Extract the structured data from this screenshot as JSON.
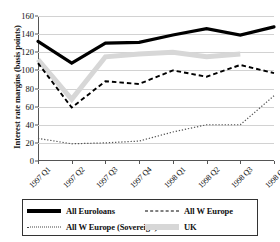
{
  "chart_data": {
    "type": "line",
    "title": "",
    "xlabel": "",
    "ylabel": "Interest rate margins (basis points)",
    "categories": [
      "1997 Q1",
      "1997 Q2",
      "1997 Q3",
      "1997 Q4",
      "1998 Q1",
      "1998 Q2",
      "1998 Q3",
      "1998 Q4"
    ],
    "ylim": [
      0,
      160
    ],
    "yticks": [
      0,
      20,
      40,
      60,
      80,
      100,
      120,
      140,
      160
    ],
    "grid": true,
    "legend_position": "bottom",
    "series": [
      {
        "name": "All Euroloans",
        "style": "solid-thick",
        "color": "#000000",
        "values": [
          132,
          108,
          130,
          131,
          139,
          146,
          139,
          148
        ]
      },
      {
        "name": "All W Europe",
        "style": "dashed",
        "color": "#000000",
        "values": [
          108,
          59,
          88,
          85,
          100,
          93,
          106,
          97
        ]
      },
      {
        "name": "All W Europe (Sovereign)",
        "style": "dotted",
        "color": "#555555",
        "values": [
          25,
          19,
          20,
          22,
          32,
          40,
          40,
          72
        ]
      },
      {
        "name": "UK",
        "style": "solid-thick-gray",
        "color": "#d7d7d7",
        "values": [
          112,
          68,
          115,
          118,
          120,
          115,
          118,
          null
        ]
      }
    ]
  },
  "legend": {
    "items": [
      {
        "label": "All Euroloans",
        "swatch": "sw-solid"
      },
      {
        "label": "All W Europe",
        "swatch": "sw-dashed"
      },
      {
        "label": "All W Europe (Sovereign)",
        "swatch": "sw-dotted"
      },
      {
        "label": "UK",
        "swatch": "sw-gray"
      }
    ]
  }
}
